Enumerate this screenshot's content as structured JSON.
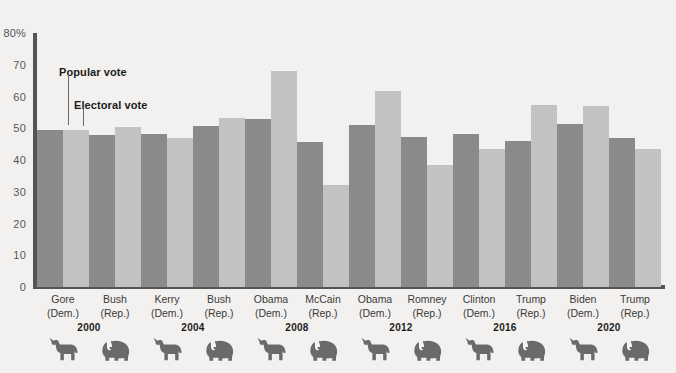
{
  "header": {
    "clipped_remnant": ""
  },
  "chart_data": {
    "type": "bar",
    "title": "",
    "xlabel": "",
    "ylabel": "",
    "ylim": [
      0,
      80
    ],
    "yticks": [
      0,
      10,
      20,
      30,
      40,
      50,
      60,
      70,
      80
    ],
    "ytick_labels": [
      "0",
      "10",
      "20",
      "30",
      "40",
      "50",
      "60",
      "70",
      "80%"
    ],
    "grid": false,
    "legend_position": "inside-upper-left",
    "series": [
      {
        "name": "Popular vote",
        "color": "#8a8a8a",
        "values": [
          49.4,
          47.9,
          48.3,
          50.7,
          52.9,
          45.7,
          51.1,
          47.2,
          48.2,
          46.1,
          51.3,
          46.9
        ]
      },
      {
        "name": "Electoral vote",
        "color": "#c2c2c2",
        "values": [
          49.4,
          50.4,
          46.8,
          53.2,
          68.0,
          32.2,
          61.7,
          38.3,
          43.5,
          57.2,
          57.1,
          43.4
        ]
      }
    ],
    "categories": [
      {
        "name": "Gore",
        "party": "(Dem.)",
        "party_key": "dem",
        "year": "2000"
      },
      {
        "name": "Bush",
        "party": "(Rep.)",
        "party_key": "rep",
        "year": "2000"
      },
      {
        "name": "Kerry",
        "party": "(Dem.)",
        "party_key": "dem",
        "year": "2004"
      },
      {
        "name": "Bush",
        "party": "(Rep.)",
        "party_key": "rep",
        "year": "2004"
      },
      {
        "name": "Obama",
        "party": "(Dem.)",
        "party_key": "dem",
        "year": "2008"
      },
      {
        "name": "McCain",
        "party": "(Rep.)",
        "party_key": "rep",
        "year": "2008"
      },
      {
        "name": "Obama",
        "party": "(Dem.)",
        "party_key": "dem",
        "year": "2012"
      },
      {
        "name": "Romney",
        "party": "(Rep.)",
        "party_key": "rep",
        "year": "2012"
      },
      {
        "name": "Clinton",
        "party": "(Dem.)",
        "party_key": "dem",
        "year": "2016"
      },
      {
        "name": "Trump",
        "party": "(Rep.)",
        "party_key": "rep",
        "year": "2016"
      },
      {
        "name": "Biden",
        "party": "(Dem.)",
        "party_key": "dem",
        "year": "2020"
      },
      {
        "name": "Trump",
        "party": "(Rep.)",
        "party_key": "rep",
        "year": "2020"
      }
    ],
    "years": [
      "2000",
      "2004",
      "2008",
      "2012",
      "2016",
      "2020"
    ],
    "annotations": [
      {
        "label": "Popular vote",
        "target": "gore-popular-bar"
      },
      {
        "label": "Electoral vote",
        "target": "gore-electoral-bar"
      }
    ]
  },
  "icons": {
    "dem": "donkey-icon",
    "rep": "elephant-icon"
  }
}
